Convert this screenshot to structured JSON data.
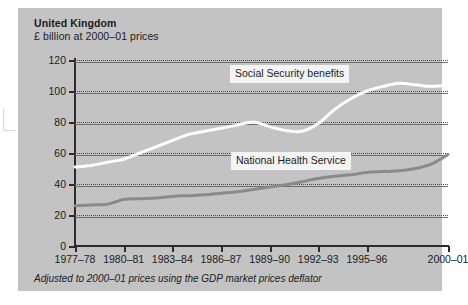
{
  "chart_data": {
    "type": "line",
    "title": "United Kingdom",
    "subtitle": "£ billion at 2000–01 prices",
    "xlabel": "",
    "ylabel": "",
    "ylim": [
      0,
      120
    ],
    "yticks": [
      0,
      20,
      40,
      60,
      80,
      100,
      120
    ],
    "grid": true,
    "legend_position": "inline-callout",
    "footnote": "Adjusted to 2000–01 prices using the GDP market prices deflator",
    "categories": [
      "1977–78",
      "1978–79",
      "1979–80",
      "1980–81",
      "1981–82",
      "1982–83",
      "1983–84",
      "1984–85",
      "1985–86",
      "1986–87",
      "1987–88",
      "1988–89",
      "1989–90",
      "1990–91",
      "1991–92",
      "1992–93",
      "1993–94",
      "1994–95",
      "1995–96",
      "1996–97",
      "1997–98",
      "1998–99",
      "1999–00",
      "2000–01"
    ],
    "xtick_labels": [
      "1977–78",
      "1980–81",
      "1983–84",
      "1986–87",
      "1989–90",
      "1992–93",
      "1995–96",
      "2000–01"
    ],
    "xtick_categories": [
      "1977–78",
      "1980–81",
      "1983–84",
      "1986–87",
      "1989–90",
      "1992–93",
      "1995–96",
      "2000–01"
    ],
    "series": [
      {
        "name": "Social Security benefits",
        "color": "#ffffff",
        "values": [
          51,
          52,
          54,
          56,
          60,
          64,
          68,
          72,
          74,
          76,
          78,
          80,
          77,
          74.5,
          74,
          79,
          88,
          95,
          100,
          103,
          105,
          104,
          103,
          104
        ]
      },
      {
        "name": "National Health Service",
        "color": "#8a8a8a",
        "values": [
          26,
          26.5,
          27,
          30,
          30.5,
          31,
          32,
          32.5,
          33,
          34,
          35,
          36.5,
          38,
          39.5,
          41.5,
          43.5,
          45,
          46,
          47.5,
          48,
          48.5,
          50,
          53,
          59
        ]
      }
    ]
  },
  "labels": {
    "social_security": "Social Security benefits",
    "national_health": "National Health Service"
  },
  "colors": {
    "panel": "#c3c3c3",
    "axis": "#2b2b2b",
    "grid_solid": "#6e6e6e",
    "grid_dotted": "#4a4a4a",
    "social_security": "#ffffff",
    "national_health": "#8a8a8a",
    "callout_bg": "#f4f4f4",
    "text": "#1b1b1b"
  }
}
